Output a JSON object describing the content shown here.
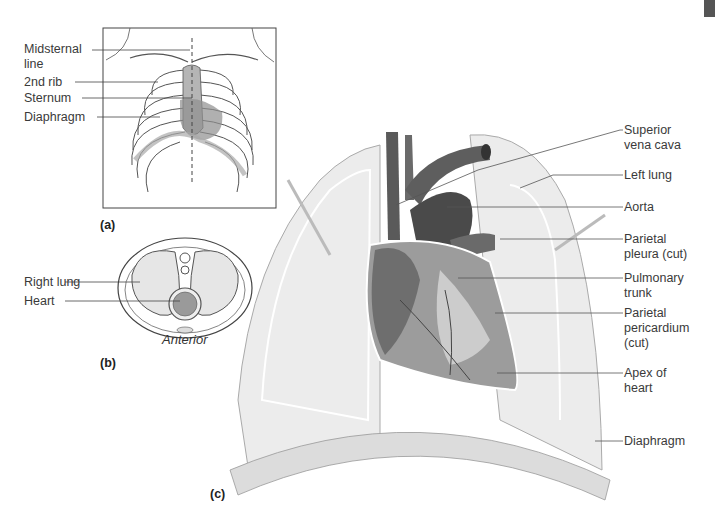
{
  "figure": {
    "panels": {
      "a": {
        "tag": "(a)",
        "labels": [
          "Midsternal\nline",
          "2nd rib",
          "Sternum",
          "Diaphragm"
        ]
      },
      "b": {
        "tag": "(b)",
        "orientation": "Anterior",
        "labels": [
          "Right lung",
          "Heart"
        ]
      },
      "c": {
        "tag": "(c)",
        "labels": [
          "Superior\nvena cava",
          "Left lung",
          "Aorta",
          "Parietal\npleura (cut)",
          "Pulmonary\ntrunk",
          "Parietal\npericardium\n(cut)",
          "Apex of\nheart",
          "Diaphragm"
        ]
      }
    },
    "colors": {
      "vessel": "#5a5a5a",
      "lung": "#e6e6e6",
      "heart": "#8a8a8a",
      "line": "#555555"
    }
  }
}
